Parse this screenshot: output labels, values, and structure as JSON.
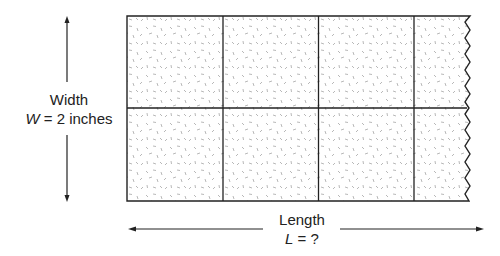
{
  "width_label": {
    "title": "Width",
    "var": "W",
    "rest": " = 2 inches"
  },
  "length_label": {
    "title": "Length",
    "var": "L",
    "rest": " = ?"
  },
  "grid": {
    "columns_full": 3,
    "rows": 2,
    "partial_column": true
  },
  "colors": {
    "line": "#222222",
    "texture": "#9a9a9a"
  }
}
